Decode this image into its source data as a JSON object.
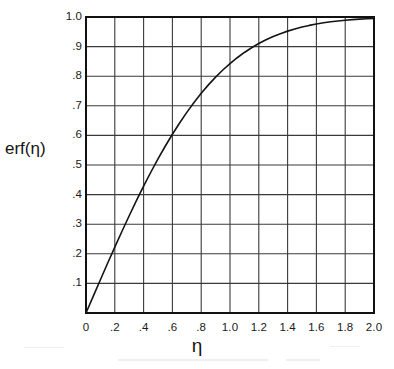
{
  "figure": {
    "background_color": "#ffffff",
    "ink_color": "#1a1a1a",
    "grid_color": "#3a3a3a",
    "frame_color": "#111111"
  },
  "axis_titles": {
    "y": "erf(η)",
    "x": "η"
  },
  "chart_data": {
    "type": "line",
    "title": "",
    "subtitle": "",
    "xlabel": "η",
    "ylabel": "erf(η)",
    "xlim": [
      0,
      2.0
    ],
    "ylim": [
      0,
      1.0
    ],
    "grid": true,
    "legend": null,
    "legend_position": "none",
    "x_major_step": 0.2,
    "y_major_step": 0.1,
    "xticks": [
      0,
      0.2,
      0.4,
      0.6,
      0.8,
      1.0,
      1.2,
      1.4,
      1.6,
      1.8,
      2.0
    ],
    "xtick_labels": [
      "0",
      ".2",
      ".4",
      ".6",
      ".8",
      "1.0",
      "1.2",
      "1.4",
      "1.6",
      "1.8",
      "2.0"
    ],
    "yticks": [
      0.1,
      0.2,
      0.3,
      0.4,
      0.5,
      0.6,
      0.7,
      0.8,
      0.9,
      1.0
    ],
    "ytick_labels": [
      ".1",
      ".2",
      ".3",
      ".4",
      ".5",
      ".6",
      ".7",
      ".8",
      ".9",
      "1.0"
    ],
    "series": [
      {
        "name": "erf(η)",
        "color": "#141414",
        "line_width": 1.6,
        "x": [
          0.0,
          0.05,
          0.1,
          0.15,
          0.2,
          0.25,
          0.3,
          0.35,
          0.4,
          0.45,
          0.5,
          0.55,
          0.6,
          0.65,
          0.7,
          0.75,
          0.8,
          0.85,
          0.9,
          0.95,
          1.0,
          1.05,
          1.1,
          1.15,
          1.2,
          1.25,
          1.3,
          1.35,
          1.4,
          1.45,
          1.5,
          1.55,
          1.6,
          1.65,
          1.7,
          1.75,
          1.8,
          1.85,
          1.9,
          1.95,
          2.0
        ],
        "values": [
          0.0,
          0.0564,
          0.1125,
          0.168,
          0.2227,
          0.2763,
          0.3286,
          0.3794,
          0.4284,
          0.4755,
          0.5205,
          0.5633,
          0.6039,
          0.642,
          0.6778,
          0.7112,
          0.7421,
          0.7707,
          0.7969,
          0.8209,
          0.8427,
          0.8624,
          0.8802,
          0.8961,
          0.9103,
          0.9229,
          0.934,
          0.9438,
          0.9523,
          0.9597,
          0.9661,
          0.9716,
          0.9763,
          0.9804,
          0.9838,
          0.9867,
          0.9891,
          0.9911,
          0.9928,
          0.9942,
          0.9953
        ]
      }
    ]
  }
}
